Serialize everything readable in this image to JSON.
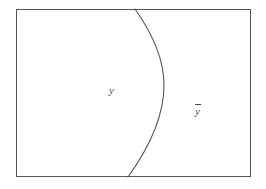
{
  "figure": {
    "kind": "set-diagram",
    "width": 266,
    "height": 189,
    "background_color": "#ffffff"
  },
  "universe": {
    "name": "universal-set-rectangle",
    "stroke_color": "#555555",
    "stroke_width": 1,
    "fill_color": "#ffffff",
    "x": 16,
    "y": 9,
    "width": 235,
    "height": 168
  },
  "divider": {
    "name": "boundary-curve",
    "stroke_color": "#555555",
    "stroke_width": 1.1,
    "fill": "none",
    "path": "M 135 9 C 152 33, 164 58, 164 85 C 164 118, 146 152, 128 177",
    "top_intersection_x": 135,
    "bottom_intersection_x": 128,
    "rightmost_x": 164,
    "rightmost_y": 85
  },
  "labels": {
    "left_region": "y",
    "right_region_base": "y",
    "right_region_full": "ȳ",
    "right_region_has_overbar": true,
    "text_color": "#4a4a4a"
  },
  "chart_data": {
    "type": "diagram",
    "title": "",
    "regions": [
      {
        "id": "y",
        "label": "y",
        "position": "left-of-curve",
        "label_x": 113,
        "label_y": 91
      },
      {
        "id": "y-complement",
        "label": "ȳ",
        "position": "right-of-curve",
        "label_x": 199,
        "label_y": 112
      }
    ]
  }
}
